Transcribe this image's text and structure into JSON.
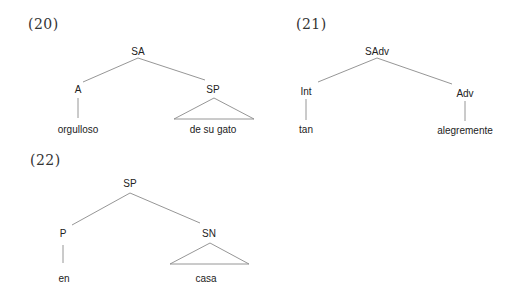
{
  "trees": [
    {
      "number": "(20)",
      "root": "SA",
      "left": {
        "label": "A",
        "leaf": "orgulloso"
      },
      "right": {
        "label": "SP",
        "leaf": "de su gato",
        "triangle": true
      }
    },
    {
      "number": "(21)",
      "root": "SAdv",
      "left": {
        "label": "Int",
        "leaf": "tan"
      },
      "right": {
        "label": "Adv",
        "leaf": "alegremente",
        "triangle": false
      }
    },
    {
      "number": "(22)",
      "root": "SP",
      "left": {
        "label": "P",
        "leaf": "en"
      },
      "right": {
        "label": "SN",
        "leaf": "casa",
        "triangle": true
      }
    }
  ]
}
